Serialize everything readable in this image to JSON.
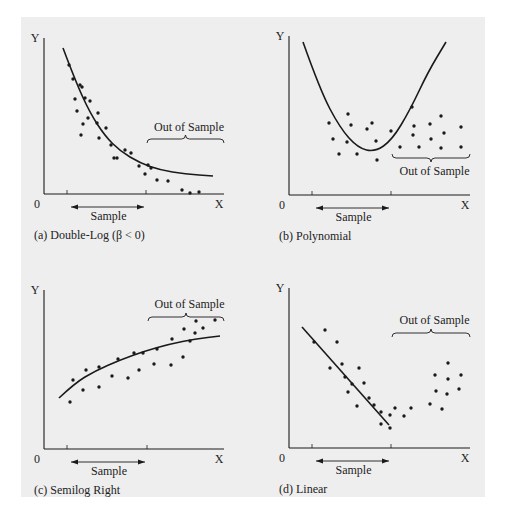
{
  "figure": {
    "background": "#eeeeee",
    "ink_color": "#1a1a1a"
  },
  "chart_data": [
    {
      "id": "a",
      "type": "scatter",
      "title": "(a) Double-Log (β < 0)",
      "xlabel": "X",
      "ylabel": "Y",
      "origin_label": "0",
      "sample_label": "Sample",
      "out_of_sample_label": "Out of Sample",
      "out_of_sample_position": "above",
      "fit_type": "double-log decreasing curve",
      "grid": false,
      "sample_points": [
        [
          69,
          65
        ],
        [
          73,
          79
        ],
        [
          80,
          85
        ],
        [
          75,
          99
        ],
        [
          82,
          87
        ],
        [
          85,
          98
        ],
        [
          77,
          111
        ],
        [
          90,
          101
        ],
        [
          88,
          118
        ],
        [
          98,
          113
        ],
        [
          97,
          123
        ],
        [
          83,
          124
        ],
        [
          81,
          135
        ],
        [
          99,
          138
        ],
        [
          106,
          128
        ],
        [
          111,
          145
        ],
        [
          117,
          158
        ],
        [
          125,
          150
        ],
        [
          131,
          153
        ],
        [
          139,
          166
        ],
        [
          114,
          158
        ]
      ],
      "out_of_sample_points": [
        [
          148,
          165
        ],
        [
          145,
          174
        ],
        [
          157,
          180
        ],
        [
          168,
          181
        ],
        [
          182,
          190
        ],
        [
          190,
          193
        ],
        [
          199,
          192
        ],
        [
          151,
          168
        ]
      ],
      "curve": [
        [
          63,
          48
        ],
        [
          75,
          80
        ],
        [
          90,
          113
        ],
        [
          105,
          136
        ],
        [
          120,
          151
        ],
        [
          140,
          163
        ],
        [
          160,
          170
        ],
        [
          185,
          174
        ],
        [
          213,
          176
        ]
      ],
      "sample_range_px": [
        67,
        146
      ],
      "out_of_sample_range_px": [
        146,
        224
      ]
    },
    {
      "id": "b",
      "type": "scatter",
      "title": "(b) Polynomial",
      "xlabel": "X",
      "ylabel": "Y",
      "origin_label": "0",
      "sample_label": "Sample",
      "out_of_sample_label": "Out of Sample",
      "out_of_sample_position": "below",
      "fit_type": "quadratic (U-shaped) curve",
      "grid": false,
      "sample_points": [
        [
          329,
          123
        ],
        [
          333,
          139
        ],
        [
          339,
          154
        ],
        [
          347,
          142
        ],
        [
          348,
          114
        ],
        [
          351,
          125
        ],
        [
          357,
          154
        ],
        [
          367,
          129
        ],
        [
          372,
          123
        ],
        [
          377,
          160
        ],
        [
          376,
          141
        ],
        [
          391,
          131
        ]
      ],
      "out_of_sample_points": [
        [
          400,
          147
        ],
        [
          412,
          107
        ],
        [
          414,
          126
        ],
        [
          413,
          135
        ],
        [
          419,
          147
        ],
        [
          430,
          124
        ],
        [
          431,
          139
        ],
        [
          441,
          116
        ],
        [
          444,
          133
        ],
        [
          441,
          148
        ],
        [
          461,
          127
        ],
        [
          461,
          147
        ]
      ],
      "curve": [
        [
          303,
          42
        ],
        [
          320,
          90
        ],
        [
          340,
          128
        ],
        [
          358,
          148
        ],
        [
          375,
          152
        ],
        [
          392,
          140
        ],
        [
          410,
          110
        ],
        [
          428,
          72
        ],
        [
          446,
          42
        ]
      ],
      "sample_range_px": [
        312,
        391
      ],
      "out_of_sample_range_px": [
        391,
        470
      ]
    },
    {
      "id": "c",
      "type": "scatter",
      "title": "(c) Semilog Right",
      "xlabel": "X",
      "ylabel": "Y",
      "origin_label": "0",
      "sample_label": "Sample",
      "out_of_sample_label": "Out of Sample",
      "out_of_sample_position": "above",
      "fit_type": "semilog increasing concave curve",
      "grid": false,
      "sample_points": [
        [
          70,
          402
        ],
        [
          73,
          380
        ],
        [
          83,
          390
        ],
        [
          86,
          370
        ],
        [
          99,
          387
        ],
        [
          99,
          367
        ],
        [
          112,
          376
        ],
        [
          118,
          359
        ],
        [
          128,
          378
        ],
        [
          134,
          353
        ],
        [
          139,
          370
        ],
        [
          143,
          353
        ]
      ],
      "out_of_sample_points": [
        [
          154,
          364
        ],
        [
          157,
          349
        ],
        [
          171,
          365
        ],
        [
          172,
          339
        ],
        [
          183,
          357
        ],
        [
          184,
          329
        ],
        [
          190,
          341
        ],
        [
          195,
          333
        ],
        [
          196,
          321
        ],
        [
          203,
          328
        ],
        [
          215,
          320
        ]
      ],
      "curve": [
        [
          59,
          398
        ],
        [
          75,
          383
        ],
        [
          95,
          371
        ],
        [
          120,
          360
        ],
        [
          145,
          351
        ],
        [
          170,
          344
        ],
        [
          195,
          339
        ],
        [
          220,
          336
        ]
      ],
      "sample_range_px": [
        67,
        147
      ],
      "out_of_sample_range_px": [
        147,
        224
      ]
    },
    {
      "id": "d",
      "type": "scatter",
      "title": "(d) Linear",
      "xlabel": "X",
      "ylabel": "Y",
      "origin_label": "0",
      "sample_label": "Sample",
      "out_of_sample_label": "Out of Sample",
      "out_of_sample_position": "above",
      "fit_type": "linear decreasing line",
      "grid": false,
      "sample_points": [
        [
          314,
          342
        ],
        [
          325,
          330
        ],
        [
          330,
          368
        ],
        [
          337,
          342
        ],
        [
          342,
          364
        ],
        [
          345,
          377
        ],
        [
          348,
          392
        ],
        [
          352,
          384
        ],
        [
          357,
          406
        ],
        [
          359,
          368
        ],
        [
          364,
          383
        ],
        [
          369,
          398
        ],
        [
          374,
          405
        ],
        [
          381,
          412
        ],
        [
          381,
          424
        ],
        [
          390,
          415
        ],
        [
          390,
          428
        ]
      ],
      "out_of_sample_points": [
        [
          395,
          408
        ],
        [
          404,
          416
        ],
        [
          411,
          408
        ],
        [
          430,
          404
        ],
        [
          435,
          375
        ],
        [
          436,
          391
        ],
        [
          442,
          409
        ],
        [
          448,
          363
        ],
        [
          448,
          379
        ],
        [
          447,
          394
        ],
        [
          459,
          389
        ],
        [
          461,
          375
        ]
      ],
      "curve": [
        [
          302,
          327
        ],
        [
          389,
          425
        ]
      ],
      "sample_range_px": [
        312,
        391
      ],
      "out_of_sample_range_px": [
        391,
        470
      ]
    }
  ]
}
